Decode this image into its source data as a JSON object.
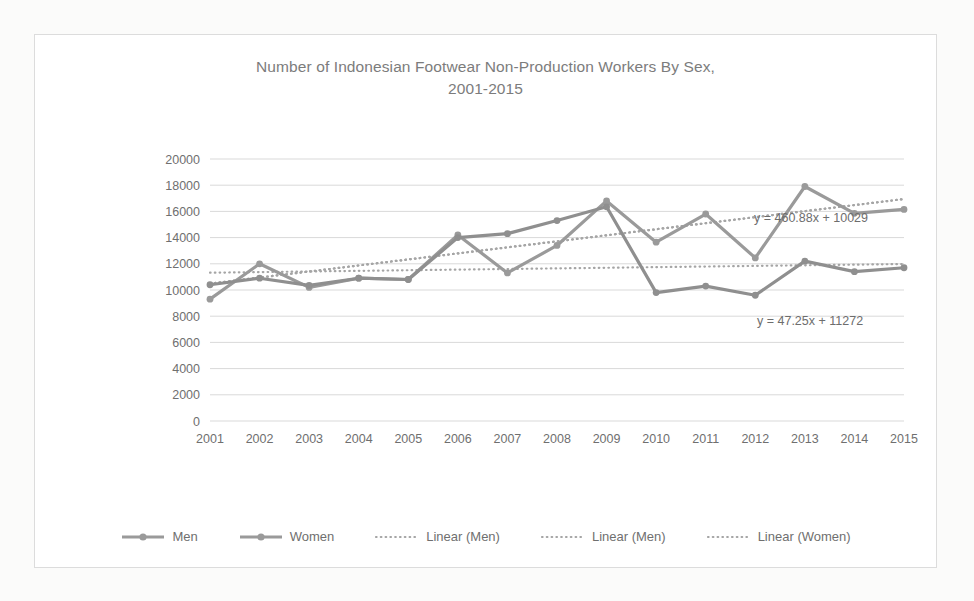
{
  "chart_data": {
    "type": "line",
    "title": "Number of Indonesian Footwear Non-Production Workers By Sex, 2001-2015",
    "title_line1": "Number of Indonesian Footwear Non-Production Workers By Sex,",
    "title_line2": "2001-2015",
    "xlabel": "",
    "ylabel": "",
    "categories": [
      "2001",
      "2002",
      "2003",
      "2004",
      "2005",
      "2006",
      "2007",
      "2008",
      "2009",
      "2010",
      "2011",
      "2012",
      "2013",
      "2014",
      "2015"
    ],
    "ylim": [
      0,
      20000
    ],
    "ytick_step": 2000,
    "yticks": [
      "20000",
      "18000",
      "16000",
      "14000",
      "12000",
      "10000",
      "8000",
      "6000",
      "4000",
      "2000",
      "0"
    ],
    "grid": true,
    "legend_position": "bottom",
    "series": [
      {
        "name": "Men",
        "type": "line-marker",
        "color": "#9a9a9a",
        "values": [
          9300,
          12000,
          10200,
          10900,
          10800,
          14200,
          11300,
          13400,
          16800,
          13650,
          15800,
          12450,
          17900,
          15850,
          16150
        ]
      },
      {
        "name": "Women",
        "type": "line-marker",
        "color": "#8f8f8f",
        "values": [
          10400,
          10900,
          10350,
          10900,
          10800,
          14000,
          14300,
          15300,
          16350,
          9800,
          10300,
          9600,
          12200,
          11400,
          11700
        ]
      },
      {
        "name": "Linear (Men)",
        "type": "trendline-dotted",
        "color": "#a5a5a5",
        "equation": "y = 460.88x + 10029",
        "slope": 460.88,
        "intercept": 10029
      },
      {
        "name": "Linear (Men)",
        "type": "trendline-dotted",
        "color": "#a5a5a5",
        "equation": "y = 460.88x + 10029",
        "slope": 460.88,
        "intercept": 10029
      },
      {
        "name": "Linear (Women)",
        "type": "trendline-dotted",
        "color": "#a5a5a5",
        "equation": "y = 47.25x + 11272",
        "slope": 47.25,
        "intercept": 11272
      }
    ],
    "annotations": [
      {
        "text": "y = 460.88x + 10029",
        "series": "Linear (Men)"
      },
      {
        "text": "y = 47.25x + 11272",
        "series": "Linear (Women)"
      }
    ]
  },
  "legend": {
    "items": [
      {
        "label": "Men",
        "key": "line-marker"
      },
      {
        "label": "Women",
        "key": "line-marker"
      },
      {
        "label": "Linear (Men)",
        "key": "dotted-line"
      },
      {
        "label": "Linear (Men)",
        "key": "dotted-line"
      },
      {
        "label": "Linear (Women)",
        "key": "dotted-line"
      }
    ]
  },
  "colors": {
    "series_gray": "#9a9a9a",
    "trend_gray": "#a5a5a5",
    "grid": "#d9d9d9",
    "text": "#6f6f6f",
    "border": "#dcdcdc"
  }
}
